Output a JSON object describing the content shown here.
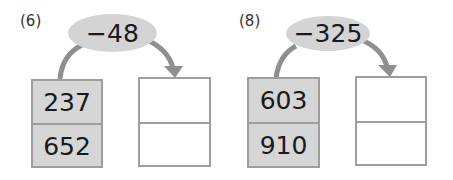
{
  "problems": [
    {
      "label": "(6)",
      "operator": "−48",
      "inputs": [
        "237",
        "652"
      ],
      "outputs": [
        "",
        ""
      ]
    },
    {
      "label": "(8)",
      "operator": "−325",
      "inputs": [
        "603",
        "910"
      ],
      "outputs": [
        "",
        ""
      ]
    }
  ],
  "colors": {
    "oval_fill": "#d4d4d4",
    "input_box_fill": "#d6d6d6",
    "border": "#9e9e9e",
    "arrow": "#8f8f8f"
  }
}
